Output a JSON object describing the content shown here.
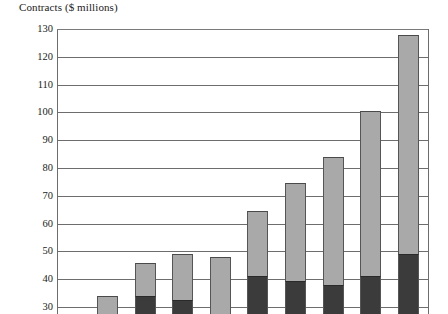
{
  "chart_data": {
    "type": "bar",
    "title": "Contracts ($ millions)",
    "xlabel": "",
    "ylabel": "Contracts ($ millions)",
    "ylim": [
      30,
      130
    ],
    "ytick_step": 10,
    "yticks": [
      130,
      120,
      110,
      100,
      90,
      80,
      70,
      60,
      50,
      40,
      30
    ],
    "grid": true,
    "legend_position": "none",
    "stacked": true,
    "note": "Bars are stacked: a dark lower segment and a light gray upper segment. Axis is truncated at 30, so bars are clipped at the bottom of the image.",
    "categories": [
      "1",
      "2",
      "3",
      "4",
      "5",
      "6",
      "7",
      "8",
      "9"
    ],
    "series": [
      {
        "name": "lower-segment",
        "color": "#3b3b3b",
        "values": [
          null,
          34,
          32.5,
          null,
          41,
          39.5,
          38,
          41,
          49
        ]
      },
      {
        "name": "upper-segment",
        "color": "#a9a9a9",
        "values": [
          34,
          46,
          49,
          48,
          64.5,
          74.5,
          84,
          100.5,
          128
        ]
      }
    ],
    "bars": [
      {
        "index": 1,
        "total": 34,
        "dark_top": null,
        "light_top": 34
      },
      {
        "index": 2,
        "total": 46,
        "dark_top": 34,
        "light_top": 46
      },
      {
        "index": 3,
        "total": 49,
        "dark_top": 32.5,
        "light_top": 49
      },
      {
        "index": 4,
        "total": 48,
        "dark_top": null,
        "light_top": 48
      },
      {
        "index": 5,
        "total": 64.5,
        "dark_top": 41,
        "light_top": 64.5
      },
      {
        "index": 6,
        "total": 74.5,
        "dark_top": 39.5,
        "light_top": 74.5
      },
      {
        "index": 7,
        "total": 84,
        "dark_top": 38,
        "light_top": 84
      },
      {
        "index": 8,
        "total": 100.5,
        "dark_top": 41,
        "light_top": 100.5
      },
      {
        "index": 9,
        "total": 128,
        "dark_top": 49,
        "light_top": 128
      }
    ],
    "colors": {
      "light_segment": "#a9a9a9",
      "dark_segment": "#3b3b3b",
      "gridline": "#6d6d6d",
      "axis": "#6d6d6d",
      "text": "#1a1a1a",
      "background": "#ffffff"
    }
  }
}
